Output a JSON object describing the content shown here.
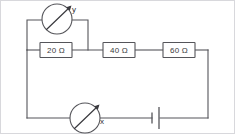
{
  "diagram": {
    "canvas": {
      "width": 235,
      "height": 134
    },
    "colors": {
      "wire": "#55555a",
      "ink": "#3c3c41",
      "background": "#ffffff",
      "frame": "#d8d8dc"
    },
    "resistors": [
      {
        "id": "r1",
        "label": "20 Ω",
        "value": 20,
        "unit": "Ω"
      },
      {
        "id": "r2",
        "label": "40 Ω",
        "value": 40,
        "unit": "Ω"
      },
      {
        "id": "r3",
        "label": "60 Ω",
        "value": 60,
        "unit": "Ω"
      }
    ],
    "meters": [
      {
        "id": "meter-y",
        "label": "y",
        "symbol": "meter-circle-arrow",
        "connection": "parallel across 20 Ω"
      },
      {
        "id": "meter-x",
        "label": "x",
        "symbol": "meter-circle-arrow",
        "connection": "series in bottom branch"
      }
    ],
    "battery": {
      "id": "battery",
      "symbol": "cell",
      "label": ""
    }
  }
}
